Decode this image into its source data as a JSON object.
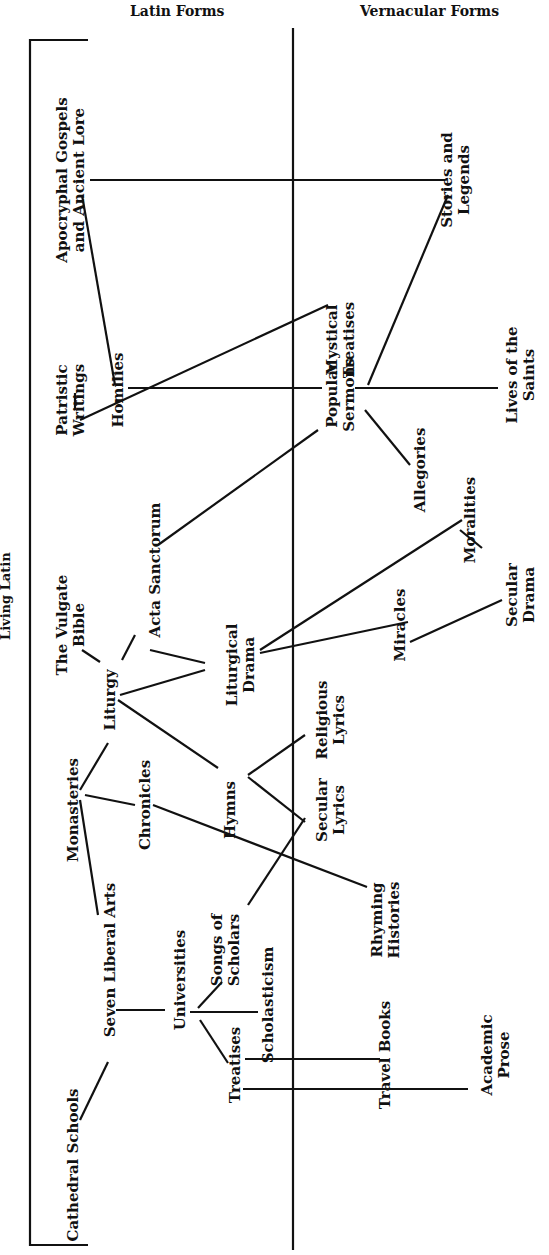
{
  "headers": {
    "latin": "Latin Forms",
    "vernacular": "Vernacular Forms",
    "living_latin": "Living Latin"
  },
  "nodes": [
    {
      "id": "apocryphal",
      "lines": [
        "Apocryphal Gospels",
        "and Ancient Lore"
      ],
      "x": 70,
      "y": 180
    },
    {
      "id": "stories",
      "lines": [
        "Stories and",
        "Legends"
      ],
      "x": 455,
      "y": 180
    },
    {
      "id": "mystical",
      "lines": [
        "Mystical",
        "Treatises"
      ],
      "x": 340,
      "y": 340
    },
    {
      "id": "patristic",
      "lines": [
        "Patristic",
        "Writings"
      ],
      "x": 70,
      "y": 400
    },
    {
      "id": "homilies",
      "lines": [
        "Homilies"
      ],
      "x": 118,
      "y": 390
    },
    {
      "id": "lives",
      "lines": [
        "Lives of the",
        "Saints"
      ],
      "x": 520,
      "y": 375
    },
    {
      "id": "popular_sermons",
      "lines": [
        "Popular",
        "Sermons"
      ],
      "x": 340,
      "y": 395
    },
    {
      "id": "allegories",
      "lines": [
        "Allegories"
      ],
      "x": 420,
      "y": 470
    },
    {
      "id": "acta",
      "lines": [
        "Acta Sanctorum"
      ],
      "x": 155,
      "y": 570
    },
    {
      "id": "moralities",
      "lines": [
        "Moralities"
      ],
      "x": 470,
      "y": 520
    },
    {
      "id": "secular_drama",
      "lines": [
        "Secular",
        "Drama"
      ],
      "x": 520,
      "y": 595
    },
    {
      "id": "vulgate",
      "lines": [
        "The Vulgate",
        "Bible"
      ],
      "x": 70,
      "y": 625
    },
    {
      "id": "liturgical_drama",
      "lines": [
        "Liturgical",
        "Drama"
      ],
      "x": 240,
      "y": 665
    },
    {
      "id": "miracles",
      "lines": [
        "Miracles"
      ],
      "x": 400,
      "y": 625
    },
    {
      "id": "liturgy",
      "lines": [
        "Liturgy"
      ],
      "x": 110,
      "y": 700
    },
    {
      "id": "religious_lyrics",
      "lines": [
        "Religious",
        "Lyrics"
      ],
      "x": 330,
      "y": 720
    },
    {
      "id": "monasteries",
      "lines": [
        "Monasteries"
      ],
      "x": 73,
      "y": 810
    },
    {
      "id": "chronicles",
      "lines": [
        "Chronicles"
      ],
      "x": 145,
      "y": 805
    },
    {
      "id": "hymns",
      "lines": [
        "Hymns"
      ],
      "x": 230,
      "y": 810
    },
    {
      "id": "secular_lyrics",
      "lines": [
        "Secular",
        "Lyrics"
      ],
      "x": 330,
      "y": 810
    },
    {
      "id": "seven_liberal_arts",
      "lines": [
        "Seven Liberal Arts"
      ],
      "x": 110,
      "y": 960
    },
    {
      "id": "rhyming_histories",
      "lines": [
        "Rhyming",
        "Histories"
      ],
      "x": 385,
      "y": 920
    },
    {
      "id": "songs_scholars",
      "lines": [
        "Songs of",
        "Scholars"
      ],
      "x": 225,
      "y": 950
    },
    {
      "id": "universities",
      "lines": [
        "Universities"
      ],
      "x": 180,
      "y": 980
    },
    {
      "id": "scholasticism",
      "lines": [
        "Scholasticism"
      ],
      "x": 268,
      "y": 1005
    },
    {
      "id": "treatises",
      "lines": [
        "Treatises"
      ],
      "x": 235,
      "y": 1065
    },
    {
      "id": "travel_books",
      "lines": [
        "Travel Books"
      ],
      "x": 385,
      "y": 1055
    },
    {
      "id": "academic_prose",
      "lines": [
        "Academic",
        "Prose"
      ],
      "x": 495,
      "y": 1055
    },
    {
      "id": "cathedral_schools",
      "lines": [
        "Cathedral Schools"
      ],
      "x": 73,
      "y": 1165
    }
  ],
  "edges": [
    [
      90,
      180,
      445,
      180
    ],
    [
      82,
      195,
      115,
      385
    ],
    [
      80,
      420,
      328,
      305
    ],
    [
      75,
      393,
      75,
      410
    ],
    [
      128,
      388,
      322,
      388
    ],
    [
      355,
      388,
      498,
      388
    ],
    [
      368,
      385,
      448,
      195
    ],
    [
      365,
      410,
      410,
      465
    ],
    [
      158,
      545,
      318,
      430
    ],
    [
      460,
      530,
      482,
      548
    ],
    [
      260,
      650,
      462,
      520
    ],
    [
      260,
      653,
      408,
      622
    ],
    [
      410,
      642,
      502,
      600
    ],
    [
      82,
      650,
      100,
      662
    ],
    [
      122,
      660,
      135,
      635
    ],
    [
      150,
      650,
      205,
      663
    ],
    [
      120,
      695,
      205,
      670
    ],
    [
      118,
      700,
      218,
      768
    ],
    [
      248,
      775,
      305,
      735
    ],
    [
      248,
      777,
      305,
      822
    ],
    [
      80,
      790,
      108,
      743
    ],
    [
      85,
      795,
      135,
      805
    ],
    [
      153,
      805,
      367,
      887
    ],
    [
      80,
      800,
      98,
      915
    ],
    [
      248,
      905,
      305,
      818
    ],
    [
      116,
      1010,
      165,
      1010
    ],
    [
      190,
      1012,
      258,
      1012
    ],
    [
      198,
      1008,
      222,
      982
    ],
    [
      200,
      1020,
      228,
      1063
    ],
    [
      245,
      1059,
      380,
      1059
    ],
    [
      243,
      1089,
      468,
      1089
    ],
    [
      80,
      1120,
      108,
      1062
    ]
  ],
  "axes": {
    "divider": {
      "x": 293,
      "y1": 28,
      "y2": 1250
    },
    "bracket": {
      "x": 30,
      "y1": 40,
      "y2": 1245,
      "tick": 88
    }
  }
}
